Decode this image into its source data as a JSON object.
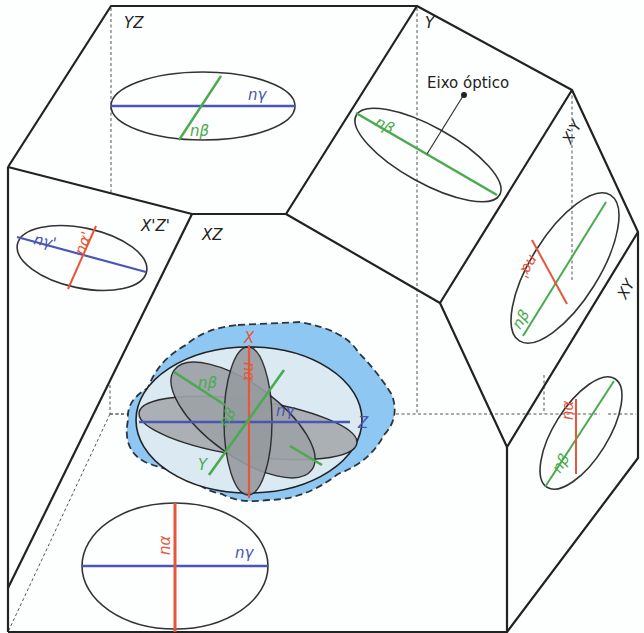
{
  "figure": {
    "face_labels": {
      "yz": "YZ",
      "y": "Y",
      "xz": "XZ",
      "x_prime_z_prime": "X'Z'",
      "x_prime_y": "X'Y",
      "xy": "XY"
    },
    "annotation": {
      "optic_axis": "Eixo óptico"
    },
    "axes": {
      "x": "X",
      "y": "Y",
      "z": "Z"
    },
    "indices": {
      "n_alpha": "nα",
      "n_beta": "nβ",
      "n_gamma": "nγ",
      "n_alpha_prime": "nα'",
      "n_gamma_prime": "nγ'"
    },
    "colors": {
      "n_alpha": "#e8553a",
      "n_beta": "#4aaa4e",
      "n_gamma": "#4a55b5",
      "indicatrix_bg": "#8ec8f2",
      "ellipsoid_fill": "#dbe9f3",
      "section_fill": "#a9adb2",
      "edge": "#222222"
    }
  }
}
